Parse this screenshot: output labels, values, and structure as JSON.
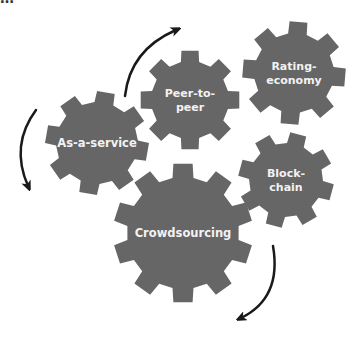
{
  "diagram": {
    "type": "interlocking-gears",
    "gear_color": "#666666",
    "label_color": "#f2f2f2",
    "arrow_color": "#1a1a1a",
    "background": "#ffffff",
    "gears": [
      {
        "id": "as-a-service",
        "lines": [
          "As-a-service"
        ],
        "cx": 97,
        "cy": 143,
        "r_outer": 52,
        "r_inner": 41,
        "teeth": 8,
        "rot": 10
      },
      {
        "id": "peer-to-peer",
        "lines": [
          "Peer-to-",
          "peer"
        ],
        "cx": 190,
        "cy": 100,
        "r_outer": 50,
        "r_inner": 39,
        "teeth": 8,
        "rot": 0
      },
      {
        "id": "rating-economy",
        "lines": [
          "Rating-",
          "economy"
        ],
        "cx": 294,
        "cy": 73,
        "r_outer": 52,
        "r_inner": 40,
        "teeth": 8,
        "rot": 5
      },
      {
        "id": "block-chain",
        "lines": [
          "Block-",
          "chain"
        ],
        "cx": 286,
        "cy": 180,
        "r_outer": 48,
        "r_inner": 37,
        "teeth": 8,
        "rot": 15
      },
      {
        "id": "crowdsourcing",
        "lines": [
          "Crowdsourcing"
        ],
        "cx": 183,
        "cy": 233,
        "r_outer": 70,
        "r_inner": 56,
        "teeth": 10,
        "rot": 0
      }
    ],
    "arrows": [
      {
        "id": "arrow-left",
        "direction": "clockwise-down",
        "path": "M36 110 Q10 145 28 186"
      },
      {
        "id": "arrow-top",
        "direction": "up-right",
        "path": "M125 96 Q130 50 176 30"
      },
      {
        "id": "arrow-bottom",
        "direction": "down-left",
        "path": "M273 246 Q282 298 241 318"
      }
    ],
    "cut_off_heading": "…"
  }
}
